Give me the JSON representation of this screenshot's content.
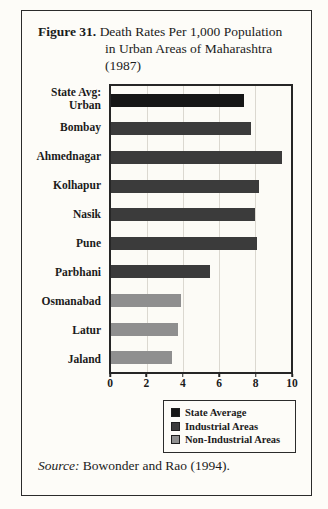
{
  "figure": {
    "label": "Figure 31.",
    "title_lines": [
      "Death Rates Per 1,000 Population",
      "in Urban Areas of Maharashtra",
      "(1987)"
    ]
  },
  "chart_data": {
    "type": "bar",
    "orientation": "horizontal",
    "title": "Figure 31. Death Rates Per 1,000 Population in Urban Areas of Maharashtra (1987)",
    "xlabel": "",
    "ylabel": "",
    "xlim": [
      0,
      10
    ],
    "xticks": [
      0,
      2,
      4,
      6,
      8,
      10
    ],
    "grid": "vertical",
    "categories": [
      "State Avg:\nUrban",
      "Bombay",
      "Ahmednagar",
      "Kolhapur",
      "Nasik",
      "Pune",
      "Parbhani",
      "Osmanabad",
      "Latur",
      "Jaland"
    ],
    "values": [
      7.4,
      7.8,
      9.5,
      8.2,
      8.0,
      8.1,
      5.5,
      3.9,
      3.7,
      3.4
    ],
    "series_by_category": [
      "state_average",
      "industrial",
      "industrial",
      "industrial",
      "industrial",
      "industrial",
      "industrial",
      "non_industrial",
      "non_industrial",
      "non_industrial"
    ],
    "legend_position": "bottom-right",
    "legend": [
      {
        "series": "state_average",
        "label": "State Average",
        "color": "#161616"
      },
      {
        "series": "industrial",
        "label": "Industrial Areas",
        "color": "#3b3b3b"
      },
      {
        "series": "non_industrial",
        "label": "Non-Industrial Areas",
        "color": "#8f8f8f"
      }
    ]
  },
  "source": {
    "label": "Source:",
    "text": " Bowonder and Rao (1994)."
  },
  "colors": {
    "background": "#fdfcf8",
    "frame_border": "#2b2b2b",
    "plot_border": "#262626",
    "gridline": "#dbd8d0",
    "text": "#1b1b1b"
  }
}
